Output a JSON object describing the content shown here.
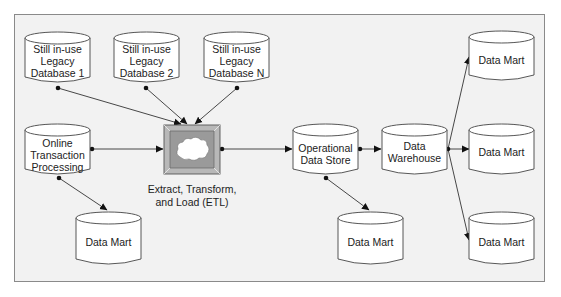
{
  "diagram": {
    "nodes": {
      "legacy_db_1": {
        "lines": [
          "Still in-use",
          "Legacy",
          "Database 1"
        ]
      },
      "legacy_db_2": {
        "lines": [
          "Still in-use",
          "Legacy",
          "Database 2"
        ]
      },
      "legacy_db_n": {
        "lines": [
          "Still in-use",
          "Legacy",
          "Database N"
        ]
      },
      "oltp": {
        "lines": [
          "Online",
          "Transaction",
          "Processing"
        ]
      },
      "etl": {
        "lines": [
          "Extract, Transform,",
          "and Load (ETL)"
        ],
        "icon": "cloud-icon"
      },
      "ods": {
        "lines": [
          "Operational",
          "Data Store"
        ]
      },
      "data_warehouse": {
        "lines": [
          "Data",
          "Warehouse"
        ]
      },
      "data_mart_oltp": {
        "lines": [
          "Data Mart"
        ]
      },
      "data_mart_ods": {
        "lines": [
          "Data Mart"
        ]
      },
      "data_mart_dw_top": {
        "lines": [
          "Data Mart"
        ]
      },
      "data_mart_dw_middle": {
        "lines": [
          "Data Mart"
        ]
      },
      "data_mart_dw_bottom": {
        "lines": [
          "Data Mart"
        ]
      }
    },
    "edges": [
      {
        "from": "legacy_db_1",
        "to": "etl"
      },
      {
        "from": "legacy_db_2",
        "to": "etl"
      },
      {
        "from": "legacy_db_n",
        "to": "etl"
      },
      {
        "from": "oltp",
        "to": "etl"
      },
      {
        "from": "oltp",
        "to": "data_mart_oltp"
      },
      {
        "from": "etl",
        "to": "ods"
      },
      {
        "from": "ods",
        "to": "data_warehouse"
      },
      {
        "from": "ods",
        "to": "data_mart_ods"
      },
      {
        "from": "data_warehouse",
        "to": "data_mart_dw_top"
      },
      {
        "from": "data_warehouse",
        "to": "data_mart_dw_middle"
      },
      {
        "from": "data_warehouse",
        "to": "data_mart_dw_bottom"
      }
    ],
    "colors": {
      "background": "#f2f2f2",
      "frame": "#8a8a8a",
      "node_fill": "#ffffff",
      "etl_fill": "#9a9a9a",
      "line": "#333333"
    }
  }
}
